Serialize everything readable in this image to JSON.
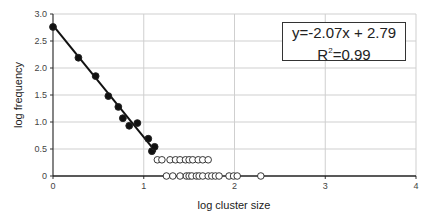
{
  "chart_data": {
    "type": "scatter",
    "title": "",
    "xlabel": "log cluster size",
    "ylabel": "log frequency",
    "xlim": [
      0,
      4
    ],
    "ylim": [
      0,
      3.0
    ],
    "x_ticks": [
      "0",
      "1",
      "2",
      "3",
      "4"
    ],
    "y_ticks": [
      "0",
      "0.5",
      "1.0",
      "1.5",
      "2.0",
      "2.5",
      "3.0"
    ],
    "grid": true,
    "legend": null,
    "series": [
      {
        "name": "fitted points (filled)",
        "marker": "filled-circle",
        "x": [
          0.0,
          0.28,
          0.47,
          0.61,
          0.72,
          0.77,
          0.84,
          0.93,
          1.05,
          1.09,
          1.12
        ],
        "y": [
          2.76,
          2.19,
          1.85,
          1.48,
          1.28,
          1.07,
          0.93,
          0.98,
          0.69,
          0.46,
          0.54
        ]
      },
      {
        "name": "excluded points (open, y≈0.3)",
        "marker": "open-circle",
        "x": [
          1.15,
          1.2,
          1.29,
          1.35,
          1.4,
          1.46,
          1.5,
          1.54,
          1.6,
          1.65,
          1.71
        ],
        "y": [
          0.3,
          0.3,
          0.3,
          0.3,
          0.3,
          0.3,
          0.3,
          0.3,
          0.3,
          0.3,
          0.3
        ]
      },
      {
        "name": "excluded points (open, y=0)",
        "marker": "open-circle",
        "x": [
          1.25,
          1.32,
          1.4,
          1.47,
          1.5,
          1.53,
          1.58,
          1.61,
          1.65,
          1.71,
          1.75,
          1.79,
          1.83,
          1.94,
          1.99,
          2.03,
          2.29
        ],
        "y": [
          0,
          0,
          0,
          0,
          0,
          0,
          0,
          0,
          0,
          0,
          0,
          0,
          0,
          0,
          0,
          0,
          0
        ]
      }
    ],
    "regression": {
      "slope": -2.07,
      "intercept": 2.79,
      "x_range": [
        0,
        1.13
      ],
      "r_squared": 0.99
    },
    "annotations": {
      "equation": "y=-2.07x + 2.79",
      "r2_label": "R",
      "r2_sup": "2",
      "r2_value": "=0.99"
    }
  }
}
